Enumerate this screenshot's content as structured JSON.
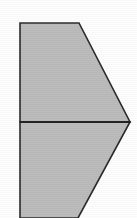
{
  "figure": {
    "title": "Right-pointing chevron polygon divided into two trapezoids",
    "kind": "geometric-line-drawing",
    "canvas": {
      "width": 137,
      "height": 218,
      "background_color": "#fefefe"
    },
    "style": {
      "fill_color": "#bcbcbc",
      "stroke_color": "#2b2b2b",
      "stroke_width": 1.6,
      "divider_stroke_color": "#232323",
      "divider_stroke_width": 1.8
    },
    "shapes": [
      {
        "name": "upper-trapezoid",
        "label": "Upper trapezoid",
        "points": "20,23 79,23 130,122 20,122",
        "fill": "#bcbcbc",
        "stroke": "#2b2b2b"
      },
      {
        "name": "lower-trapezoid",
        "label": "Lower trapezoid",
        "points": "20,122 130,122 78,218 20,218",
        "fill": "#bcbcbc",
        "stroke": "#2b2b2b"
      }
    ],
    "divider": {
      "name": "horizontal-divider",
      "label": "Horizontal dividing line",
      "x1": 20,
      "y1": 122,
      "x2": 130,
      "y2": 122
    },
    "vertices": [
      {
        "name": "top-left",
        "x": 20,
        "y": 23
      },
      {
        "name": "top-right",
        "x": 79,
        "y": 23
      },
      {
        "name": "right-apex",
        "x": 130,
        "y": 122
      },
      {
        "name": "bottom-right",
        "x": 78,
        "y": 218
      },
      {
        "name": "bottom-left",
        "x": 20,
        "y": 218
      },
      {
        "name": "mid-left",
        "x": 20,
        "y": 122
      }
    ]
  }
}
